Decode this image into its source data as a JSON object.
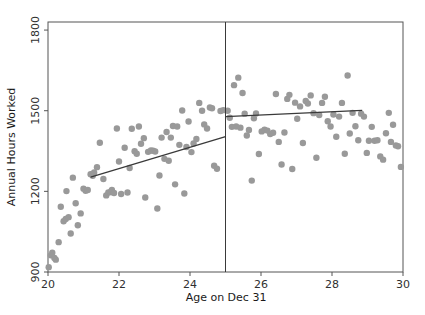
{
  "chart_data": {
    "type": "scatter",
    "title": "",
    "xlabel": "Age on Dec 31",
    "ylabel": "Annual Hours Worked",
    "xlim": [
      20,
      30
    ],
    "ylim": [
      900,
      1830
    ],
    "xticks": [
      20,
      22,
      24,
      26,
      28,
      30
    ],
    "yticks": [
      900,
      1200,
      1500,
      1800
    ],
    "xtick_labels": [
      "20",
      "22",
      "24",
      "26",
      "28",
      "30"
    ],
    "ytick_labels": [
      "900",
      "1200",
      "1500",
      "1800"
    ],
    "grid": false,
    "legend": null,
    "point_color": "#999999",
    "line_color": "#3a3a3a",
    "frame_color": "#555555",
    "point_size": 3.2,
    "cutoff": {
      "x": 25,
      "label": "",
      "color": "#3a3a3a"
    },
    "fits": [
      {
        "name": "left-fit",
        "x": [
          21.2,
          25.0
        ],
        "y": [
          1253,
          1404
        ]
      },
      {
        "name": "right-fit",
        "x": [
          25.0,
          28.85
        ],
        "y": [
          1478,
          1501
        ]
      }
    ],
    "points": [
      {
        "x": 20.02,
        "y": 918
      },
      {
        "x": 20.08,
        "y": 962
      },
      {
        "x": 20.12,
        "y": 972
      },
      {
        "x": 20.18,
        "y": 952
      },
      {
        "x": 20.22,
        "y": 946
      },
      {
        "x": 20.3,
        "y": 1011
      },
      {
        "x": 20.36,
        "y": 1143
      },
      {
        "x": 20.44,
        "y": 1089
      },
      {
        "x": 20.5,
        "y": 1097
      },
      {
        "x": 20.52,
        "y": 1201
      },
      {
        "x": 20.58,
        "y": 1104
      },
      {
        "x": 20.64,
        "y": 1043
      },
      {
        "x": 20.7,
        "y": 1251
      },
      {
        "x": 20.78,
        "y": 1156
      },
      {
        "x": 20.84,
        "y": 1074
      },
      {
        "x": 20.92,
        "y": 1118
      },
      {
        "x": 21.0,
        "y": 1210
      },
      {
        "x": 21.06,
        "y": 1202
      },
      {
        "x": 21.12,
        "y": 1205
      },
      {
        "x": 21.2,
        "y": 1264
      },
      {
        "x": 21.26,
        "y": 1258
      },
      {
        "x": 21.3,
        "y": 1270
      },
      {
        "x": 21.38,
        "y": 1290
      },
      {
        "x": 21.46,
        "y": 1381
      },
      {
        "x": 21.56,
        "y": 1246
      },
      {
        "x": 21.64,
        "y": 1185
      },
      {
        "x": 21.7,
        "y": 1196
      },
      {
        "x": 21.76,
        "y": 1197
      },
      {
        "x": 21.8,
        "y": 1205
      },
      {
        "x": 21.86,
        "y": 1194
      },
      {
        "x": 21.94,
        "y": 1434
      },
      {
        "x": 22.0,
        "y": 1311
      },
      {
        "x": 22.06,
        "y": 1190
      },
      {
        "x": 22.16,
        "y": 1362
      },
      {
        "x": 22.24,
        "y": 1196
      },
      {
        "x": 22.3,
        "y": 1287
      },
      {
        "x": 22.36,
        "y": 1433
      },
      {
        "x": 22.44,
        "y": 1349
      },
      {
        "x": 22.5,
        "y": 1340
      },
      {
        "x": 22.56,
        "y": 1441
      },
      {
        "x": 22.62,
        "y": 1377
      },
      {
        "x": 22.7,
        "y": 1398
      },
      {
        "x": 22.74,
        "y": 1177
      },
      {
        "x": 22.82,
        "y": 1347
      },
      {
        "x": 22.9,
        "y": 1352
      },
      {
        "x": 22.96,
        "y": 1351
      },
      {
        "x": 23.02,
        "y": 1348
      },
      {
        "x": 23.08,
        "y": 1136
      },
      {
        "x": 23.14,
        "y": 1259
      },
      {
        "x": 23.2,
        "y": 1400
      },
      {
        "x": 23.28,
        "y": 1321
      },
      {
        "x": 23.34,
        "y": 1421
      },
      {
        "x": 23.4,
        "y": 1314
      },
      {
        "x": 23.46,
        "y": 1400
      },
      {
        "x": 23.52,
        "y": 1443
      },
      {
        "x": 23.58,
        "y": 1226
      },
      {
        "x": 23.64,
        "y": 1441
      },
      {
        "x": 23.7,
        "y": 1373
      },
      {
        "x": 23.78,
        "y": 1501
      },
      {
        "x": 23.84,
        "y": 1192
      },
      {
        "x": 23.9,
        "y": 1365
      },
      {
        "x": 23.96,
        "y": 1460
      },
      {
        "x": 24.04,
        "y": 1346
      },
      {
        "x": 24.1,
        "y": 1378
      },
      {
        "x": 24.18,
        "y": 1395
      },
      {
        "x": 24.26,
        "y": 1529
      },
      {
        "x": 24.34,
        "y": 1500
      },
      {
        "x": 24.4,
        "y": 1449
      },
      {
        "x": 24.48,
        "y": 1434
      },
      {
        "x": 24.56,
        "y": 1512
      },
      {
        "x": 24.62,
        "y": 1509
      },
      {
        "x": 24.68,
        "y": 1295
      },
      {
        "x": 24.76,
        "y": 1284
      },
      {
        "x": 24.86,
        "y": 1499
      },
      {
        "x": 24.94,
        "y": 1502
      },
      {
        "x": 25.06,
        "y": 1500
      },
      {
        "x": 25.12,
        "y": 1474
      },
      {
        "x": 25.18,
        "y": 1440
      },
      {
        "x": 25.24,
        "y": 1595
      },
      {
        "x": 25.3,
        "y": 1441
      },
      {
        "x": 25.36,
        "y": 1623
      },
      {
        "x": 25.42,
        "y": 1437
      },
      {
        "x": 25.48,
        "y": 1566
      },
      {
        "x": 25.54,
        "y": 1489
      },
      {
        "x": 25.6,
        "y": 1408
      },
      {
        "x": 25.66,
        "y": 1428
      },
      {
        "x": 25.74,
        "y": 1240
      },
      {
        "x": 25.8,
        "y": 1472
      },
      {
        "x": 25.86,
        "y": 1490
      },
      {
        "x": 25.94,
        "y": 1339
      },
      {
        "x": 26.02,
        "y": 1423
      },
      {
        "x": 26.1,
        "y": 1429
      },
      {
        "x": 26.18,
        "y": 1426
      },
      {
        "x": 26.26,
        "y": 1413
      },
      {
        "x": 26.34,
        "y": 1418
      },
      {
        "x": 26.42,
        "y": 1562
      },
      {
        "x": 26.5,
        "y": 1384
      },
      {
        "x": 26.58,
        "y": 1300
      },
      {
        "x": 26.66,
        "y": 1419
      },
      {
        "x": 26.74,
        "y": 1544
      },
      {
        "x": 26.8,
        "y": 1559
      },
      {
        "x": 26.88,
        "y": 1283
      },
      {
        "x": 26.96,
        "y": 1530
      },
      {
        "x": 27.02,
        "y": 1470
      },
      {
        "x": 27.1,
        "y": 1516
      },
      {
        "x": 27.18,
        "y": 1380
      },
      {
        "x": 27.26,
        "y": 1536
      },
      {
        "x": 27.32,
        "y": 1527
      },
      {
        "x": 27.4,
        "y": 1557
      },
      {
        "x": 27.48,
        "y": 1491
      },
      {
        "x": 27.56,
        "y": 1325
      },
      {
        "x": 27.64,
        "y": 1484
      },
      {
        "x": 27.72,
        "y": 1529
      },
      {
        "x": 27.8,
        "y": 1552
      },
      {
        "x": 27.88,
        "y": 1461
      },
      {
        "x": 27.96,
        "y": 1441
      },
      {
        "x": 28.04,
        "y": 1486
      },
      {
        "x": 28.12,
        "y": 1403
      },
      {
        "x": 28.2,
        "y": 1478
      },
      {
        "x": 28.28,
        "y": 1529
      },
      {
        "x": 28.36,
        "y": 1340
      },
      {
        "x": 28.44,
        "y": 1631
      },
      {
        "x": 28.5,
        "y": 1415
      },
      {
        "x": 28.58,
        "y": 1492
      },
      {
        "x": 28.66,
        "y": 1442
      },
      {
        "x": 28.74,
        "y": 1390
      },
      {
        "x": 28.82,
        "y": 1489
      },
      {
        "x": 28.9,
        "y": 1478
      },
      {
        "x": 28.98,
        "y": 1343
      },
      {
        "x": 29.04,
        "y": 1388
      },
      {
        "x": 29.12,
        "y": 1440
      },
      {
        "x": 29.2,
        "y": 1388
      },
      {
        "x": 29.28,
        "y": 1390
      },
      {
        "x": 29.36,
        "y": 1330
      },
      {
        "x": 29.44,
        "y": 1318
      },
      {
        "x": 29.52,
        "y": 1416
      },
      {
        "x": 29.6,
        "y": 1492
      },
      {
        "x": 29.66,
        "y": 1384
      },
      {
        "x": 29.72,
        "y": 1448
      },
      {
        "x": 29.8,
        "y": 1371
      },
      {
        "x": 29.86,
        "y": 1368
      },
      {
        "x": 29.94,
        "y": 1291
      }
    ]
  }
}
